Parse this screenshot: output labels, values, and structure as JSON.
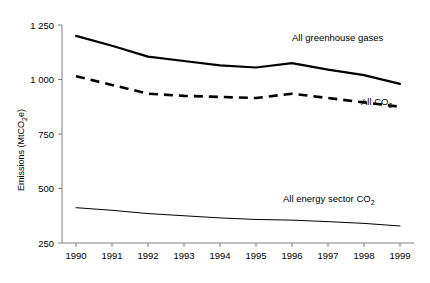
{
  "chart_data": {
    "type": "line",
    "title": "",
    "xlabel": "",
    "ylabel": "Emissions (MtCO₂e)",
    "x": [
      1990,
      1991,
      1992,
      1993,
      1994,
      1995,
      1996,
      1997,
      1998,
      1999
    ],
    "categories": [
      "1990",
      "1991",
      "1992",
      "1993",
      "1994",
      "1995",
      "1996",
      "1997",
      "1998",
      "1999"
    ],
    "xlim": [
      1990,
      1999
    ],
    "ylim": [
      250,
      1250
    ],
    "yticks": [
      250,
      500,
      750,
      1000,
      1250
    ],
    "ytick_labels": [
      "250",
      "500",
      "750",
      "1 000",
      "1 250"
    ],
    "grid": false,
    "legend_position": "inline-annotations",
    "series": [
      {
        "name": "All greenhouse gases",
        "style": "solid",
        "values": [
          1200,
          1155,
          1105,
          1085,
          1065,
          1055,
          1075,
          1045,
          1020,
          980
        ]
      },
      {
        "name": "All CO2",
        "style": "dashed",
        "values": [
          1015,
          975,
          935,
          925,
          920,
          915,
          935,
          915,
          895,
          875
        ]
      },
      {
        "name": "All energy sector CO2",
        "style": "thin-solid",
        "values": [
          412,
          400,
          385,
          375,
          365,
          358,
          355,
          348,
          340,
          328
        ]
      }
    ],
    "annotations": [
      {
        "text": "All greenhouse gases",
        "x": 1996,
        "y": 1135
      },
      {
        "text": "All CO",
        "sub": "2",
        "x": 1998,
        "y": 820
      },
      {
        "text": "All energy sector CO",
        "sub": "2",
        "x": 1996,
        "y": 290
      }
    ]
  },
  "axis": {
    "y_title": "Emissions (MtCO",
    "y_title_sub": "2",
    "y_title_tail": "e)"
  },
  "labels": {
    "ghg": "All greenhouse gases",
    "co2_main": "All CO",
    "co2_sub": "2",
    "energy_main": "All energy sector CO",
    "energy_sub": "2"
  },
  "colors": {
    "line": "#000000",
    "axis": "#808080",
    "background": "#ffffff"
  }
}
